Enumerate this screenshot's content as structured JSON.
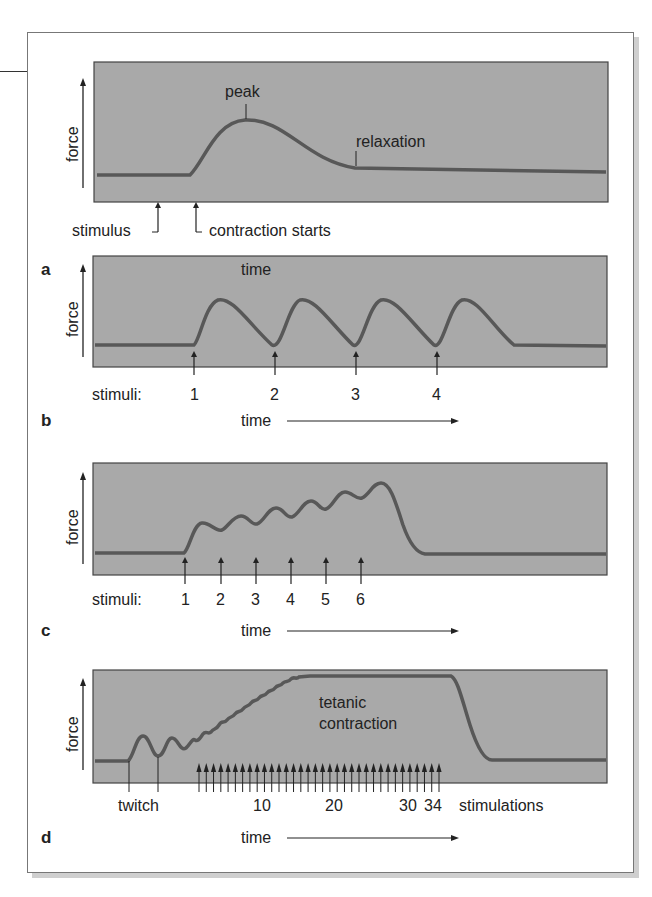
{
  "figure": {
    "panels": [
      {
        "letter": "a",
        "y_label": "force",
        "x_label": "time",
        "annotations": {
          "peak": "peak",
          "relaxation": "relaxation",
          "stimulus": "stimulus",
          "contraction_starts": "contraction starts"
        }
      },
      {
        "letter": "b",
        "y_label": "force",
        "x_label": "time",
        "stimuli_label": "stimuli:",
        "stimuli": [
          "1",
          "2",
          "3",
          "4"
        ]
      },
      {
        "letter": "c",
        "y_label": "force",
        "x_label": "time",
        "stimuli_label": "stimuli:",
        "stimuli": [
          "1",
          "2",
          "3",
          "4",
          "5",
          "6"
        ]
      },
      {
        "letter": "d",
        "y_label": "force",
        "x_label": "time",
        "annotations": {
          "tetanic_line1": "tetanic",
          "tetanic_line2": "contraction",
          "twitch": "twitch",
          "stimulations": "stimulations"
        },
        "ticks": [
          "10",
          "20",
          "30",
          "34"
        ],
        "stimulation_count": 34
      }
    ],
    "colors": {
      "graph_bg": "#a9a9a9",
      "curve": "#585858",
      "border": "#444444",
      "text": "#222222"
    }
  },
  "chart_data": [
    {
      "type": "line",
      "title": "a — single twitch",
      "xlabel": "time",
      "ylabel": "force",
      "description": "baseline, stimulus, latent period, contraction to peak, relaxation back to baseline",
      "events": [
        "stimulus",
        "contraction starts",
        "peak",
        "relaxation"
      ]
    },
    {
      "type": "line",
      "title": "b — repeated twitches, full relaxation",
      "xlabel": "time",
      "ylabel": "force",
      "stimuli": [
        1,
        2,
        3,
        4
      ],
      "description": "4 identical twitch peaks, each returning to baseline"
    },
    {
      "type": "line",
      "title": "c — summation (wave summation)",
      "xlabel": "time",
      "ylabel": "force",
      "stimuli": [
        1,
        2,
        3,
        4,
        5,
        6
      ],
      "description": "6 stimuli; each successive peak higher, incomplete relaxation, final drop to baseline"
    },
    {
      "type": "line",
      "title": "d — tetanic contraction",
      "xlabel": "time",
      "ylabel": "force",
      "stimulations": 34,
      "tick_labels": [
        "10",
        "20",
        "30",
        "34"
      ],
      "description": "two twitches then rising fused oscillations reaching sustained plateau (tetanus), then relaxation"
    }
  ]
}
